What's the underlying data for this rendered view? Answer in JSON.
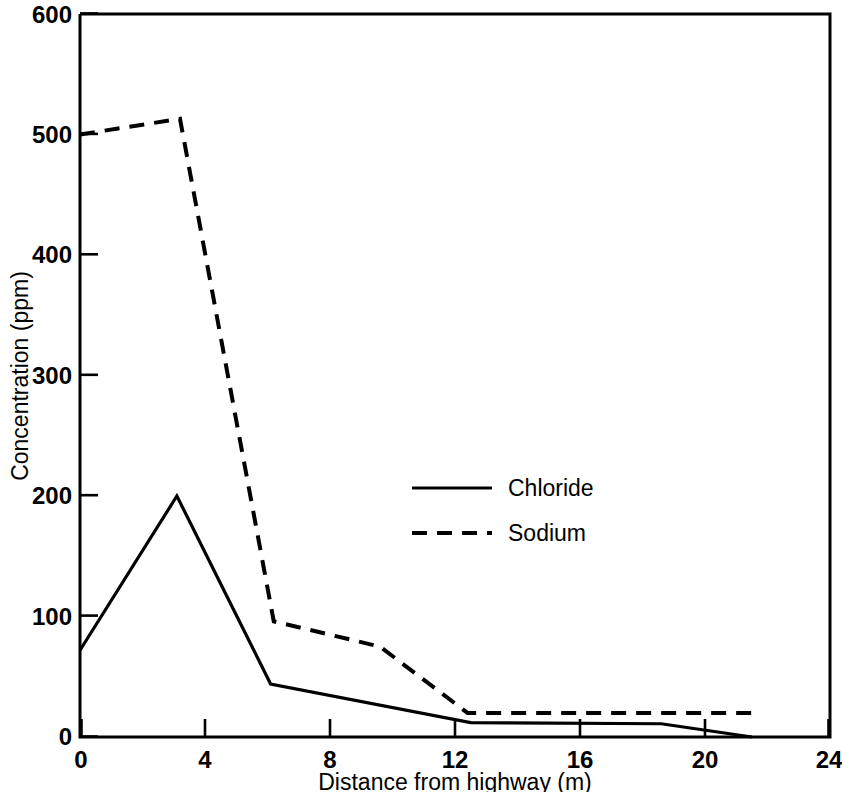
{
  "chart_data": {
    "type": "line",
    "title": "",
    "xlabel": "Distance from highway (m)",
    "ylabel": "Concentration (ppm)",
    "xlim": [
      0,
      24
    ],
    "ylim": [
      0,
      600
    ],
    "xticks": [
      "0",
      "4",
      "8",
      "12",
      "16",
      "20",
      "24"
    ],
    "yticks": [
      "0",
      "100",
      "200",
      "300",
      "400",
      "500",
      "600"
    ],
    "xtick_values": [
      0,
      4,
      8,
      12,
      16,
      20,
      24
    ],
    "ytick_values": [
      0,
      100,
      200,
      300,
      400,
      500,
      600
    ],
    "grid": false,
    "legend_position": "center",
    "series": [
      {
        "name": "Chloride",
        "style": "solid",
        "x": [
          0,
          3.1,
          6.1,
          12.5,
          18.6,
          21.5
        ],
        "values": [
          72,
          200,
          44,
          12,
          11,
          0
        ]
      },
      {
        "name": "Sodium",
        "style": "dashed",
        "x": [
          0,
          3.2,
          6.2,
          9.6,
          12.4,
          21.5
        ],
        "values": [
          500,
          513,
          96,
          75,
          20,
          20
        ]
      }
    ]
  },
  "axes": {
    "y_axis_title": "Concentration (ppm)",
    "x_axis_title": "Distance from highway (m)",
    "y_tick_labels": [
      "600",
      "500",
      "400",
      "300",
      "200",
      "100",
      "0"
    ],
    "x_tick_labels": [
      "0",
      "4",
      "8",
      "12",
      "16",
      "20",
      "24"
    ]
  },
  "legend": {
    "entries": [
      {
        "label": "Chloride",
        "style": "solid"
      },
      {
        "label": "Sodium",
        "style": "dashed"
      }
    ]
  },
  "colors": {
    "ink": "#000000",
    "background": "#ffffff"
  }
}
